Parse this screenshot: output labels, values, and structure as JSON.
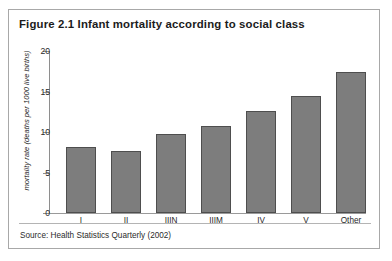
{
  "figure": {
    "title": "Figure 2.1 Infant mortality according to social class",
    "source": "Source: Health Statistics Quarterly (2002)"
  },
  "style": {
    "bar_fill": "#7d7d7d",
    "bar_border": "#4e4e4e",
    "frame_border": "#a8a8a8",
    "axis_color": "#8e8e8e",
    "background": "#ffffff"
  },
  "chart_data": {
    "type": "bar",
    "title": "Figure 2.1 Infant mortality according to social class",
    "xlabel": "",
    "ylabel": "mortality rate (deaths per 1000 live births)",
    "categories": [
      "I",
      "II",
      "IIIN",
      "IIIM",
      "IV",
      "V",
      "Other"
    ],
    "values": [
      8.1,
      7.6,
      9.8,
      10.7,
      12.6,
      14.5,
      17.4
    ],
    "ylim": [
      0,
      20
    ],
    "yticks": [
      0,
      5,
      10,
      15,
      20
    ],
    "ytick_labels": [
      "0",
      "5",
      "10",
      "15",
      "20"
    ],
    "grid": false,
    "legend": null,
    "source": "Source: Health Statistics Quarterly (2002)"
  }
}
